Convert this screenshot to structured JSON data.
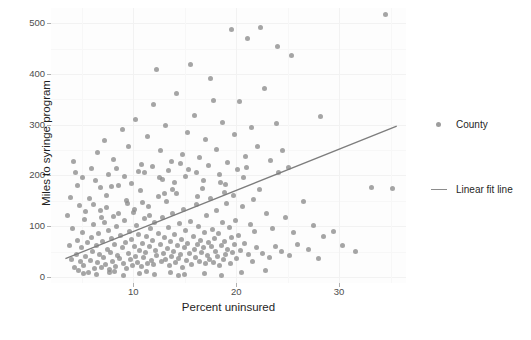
{
  "chart_data": {
    "type": "scatter",
    "title": "",
    "xlabel": "Percent uninsured",
    "ylabel": "Miles to syringe program",
    "xlim": [
      2.0,
      36.5
    ],
    "ylim": [
      -12,
      530
    ],
    "xticks": [
      10,
      20,
      30
    ],
    "xtick_labels": [
      "10",
      "20",
      "30"
    ],
    "yticks": [
      0,
      100,
      200,
      300,
      400,
      500
    ],
    "ytick_labels": [
      "0",
      "100",
      "200",
      "300",
      "400",
      "500"
    ],
    "grid": true,
    "legend_position": "right",
    "legend": [
      {
        "label": "County",
        "marker": "circle",
        "color": "#8c8c8c"
      },
      {
        "label": "Linear fit line",
        "marker": "line",
        "color": "#8c8c8c"
      }
    ],
    "series": [
      {
        "name": "County",
        "type": "scatter",
        "color": "#8c8c8c",
        "marker_size": 5,
        "opacity": 0.78,
        "points": [
          [
            3.6,
            122
          ],
          [
            3.8,
            61
          ],
          [
            4.0,
            35
          ],
          [
            4.1,
            96
          ],
          [
            4.3,
            18
          ],
          [
            4.4,
            205
          ],
          [
            4.5,
            44
          ],
          [
            4.6,
            72
          ],
          [
            4.7,
            12
          ],
          [
            4.8,
            140
          ],
          [
            4.9,
            30
          ],
          [
            5.0,
            58
          ],
          [
            5.1,
            88
          ],
          [
            5.2,
            22
          ],
          [
            5.3,
            113
          ],
          [
            5.4,
            41
          ],
          [
            5.5,
            67
          ],
          [
            5.6,
            9
          ],
          [
            5.7,
            155
          ],
          [
            5.8,
            33
          ],
          [
            5.9,
            78
          ],
          [
            6.0,
            51
          ],
          [
            6.1,
            104
          ],
          [
            6.2,
            16
          ],
          [
            6.3,
            190
          ],
          [
            6.4,
            62
          ],
          [
            6.5,
            28
          ],
          [
            6.6,
            86
          ],
          [
            6.7,
            45
          ],
          [
            6.8,
            130
          ],
          [
            6.9,
            19
          ],
          [
            7.0,
            70
          ],
          [
            7.1,
            39
          ],
          [
            7.2,
            108
          ],
          [
            7.3,
            25
          ],
          [
            7.4,
            160
          ],
          [
            7.5,
            55
          ],
          [
            7.6,
            92
          ],
          [
            7.7,
            14
          ],
          [
            7.8,
            48
          ],
          [
            7.9,
            75
          ],
          [
            8.0,
            31
          ],
          [
            8.1,
            120
          ],
          [
            8.2,
            64
          ],
          [
            8.3,
            21
          ],
          [
            8.4,
            99
          ],
          [
            8.5,
            43
          ],
          [
            8.6,
            180
          ],
          [
            8.7,
            36
          ],
          [
            8.8,
            82
          ],
          [
            8.9,
            57
          ],
          [
            9.0,
            26
          ],
          [
            9.1,
            111
          ],
          [
            9.2,
            68
          ],
          [
            9.3,
            17
          ],
          [
            9.4,
            145
          ],
          [
            9.5,
            47
          ],
          [
            9.6,
            90
          ],
          [
            9.7,
            34
          ],
          [
            9.8,
            73
          ],
          [
            9.9,
            23
          ],
          [
            10.0,
            127
          ],
          [
            10.1,
            59
          ],
          [
            10.2,
            40
          ],
          [
            10.3,
            101
          ],
          [
            10.4,
            29
          ],
          [
            10.5,
            84
          ],
          [
            10.6,
            52
          ],
          [
            10.7,
            170
          ],
          [
            10.8,
            20
          ],
          [
            10.9,
            66
          ],
          [
            11.0,
            38
          ],
          [
            11.1,
            115
          ],
          [
            11.2,
            49
          ],
          [
            11.3,
            79
          ],
          [
            11.4,
            27
          ],
          [
            11.5,
            138
          ],
          [
            11.6,
            60
          ],
          [
            11.7,
            95
          ],
          [
            11.8,
            32
          ],
          [
            11.9,
            71
          ],
          [
            12.0,
            24
          ],
          [
            12.1,
            107
          ],
          [
            12.2,
            53
          ],
          [
            12.3,
            42
          ],
          [
            12.4,
            86
          ],
          [
            12.5,
            196
          ],
          [
            12.6,
            63
          ],
          [
            12.7,
            30
          ],
          [
            12.8,
            118
          ],
          [
            12.9,
            46
          ],
          [
            13.0,
            77
          ],
          [
            13.1,
            35
          ],
          [
            13.2,
            148
          ],
          [
            13.3,
            56
          ],
          [
            13.4,
            98
          ],
          [
            13.5,
            22
          ],
          [
            13.6,
            69
          ],
          [
            13.7,
            41
          ],
          [
            13.8,
            125
          ],
          [
            13.9,
            50
          ],
          [
            14.0,
            83
          ],
          [
            14.1,
            28
          ],
          [
            14.2,
            165
          ],
          [
            14.3,
            61
          ],
          [
            14.4,
            37
          ],
          [
            14.5,
            105
          ],
          [
            14.6,
            44
          ],
          [
            14.7,
            74
          ],
          [
            14.8,
            19
          ],
          [
            14.9,
            133
          ],
          [
            15.0,
            58
          ],
          [
            15.1,
            91
          ],
          [
            15.2,
            33
          ],
          [
            15.3,
            66
          ],
          [
            15.4,
            212
          ],
          [
            15.5,
            47
          ],
          [
            15.6,
            110
          ],
          [
            15.7,
            25
          ],
          [
            15.8,
            80
          ],
          [
            15.9,
            54
          ],
          [
            16.0,
            39
          ],
          [
            16.1,
            142
          ],
          [
            16.2,
            64
          ],
          [
            16.3,
            100
          ],
          [
            16.4,
            31
          ],
          [
            16.5,
            72
          ],
          [
            16.6,
            48
          ],
          [
            16.7,
            175
          ],
          [
            16.8,
            57
          ],
          [
            16.9,
            88
          ],
          [
            17.0,
            26
          ],
          [
            17.1,
            121
          ],
          [
            17.2,
            43
          ],
          [
            17.3,
            67
          ],
          [
            17.4,
            35
          ],
          [
            17.5,
            155
          ],
          [
            17.6,
            59
          ],
          [
            17.7,
            94
          ],
          [
            17.8,
            29
          ],
          [
            17.9,
            76
          ],
          [
            18.0,
            51
          ],
          [
            18.1,
            130
          ],
          [
            18.2,
            40
          ],
          [
            18.3,
            85
          ],
          [
            18.4,
            23
          ],
          [
            18.5,
            186
          ],
          [
            18.6,
            62
          ],
          [
            18.7,
            108
          ],
          [
            18.8,
            34
          ],
          [
            18.9,
            70
          ],
          [
            19.0,
            45
          ],
          [
            19.1,
            145
          ],
          [
            19.2,
            55
          ],
          [
            19.3,
            97
          ],
          [
            19.4,
            27
          ],
          [
            19.5,
            78
          ],
          [
            19.6,
            49
          ],
          [
            19.7,
            160
          ],
          [
            19.8,
            63
          ],
          [
            19.9,
            112
          ],
          [
            20.0,
            36
          ],
          [
            20.2,
            82
          ],
          [
            20.4,
            52
          ],
          [
            20.6,
            138
          ],
          [
            20.8,
            66
          ],
          [
            21.0,
            215
          ],
          [
            21.2,
            44
          ],
          [
            21.4,
            103
          ],
          [
            21.6,
            30
          ],
          [
            21.8,
            90
          ],
          [
            22.0,
            57
          ],
          [
            22.3,
            172
          ],
          [
            22.6,
            47
          ],
          [
            22.9,
            125
          ],
          [
            23.2,
            38
          ],
          [
            23.5,
            96
          ],
          [
            23.8,
            60
          ],
          [
            24.1,
            205
          ],
          [
            24.4,
            50
          ],
          [
            24.8,
            117
          ],
          [
            25.2,
            42
          ],
          [
            25.6,
            88
          ],
          [
            26.0,
            64
          ],
          [
            26.5,
            148
          ],
          [
            27.0,
            55
          ],
          [
            27.5,
            102
          ],
          [
            28.0,
            36
          ],
          [
            28.5,
            80
          ],
          [
            6.5,
            245
          ],
          [
            7.2,
            268
          ],
          [
            8.1,
            232
          ],
          [
            8.9,
            290
          ],
          [
            9.5,
            258
          ],
          [
            10.2,
            310
          ],
          [
            10.8,
            222
          ],
          [
            11.4,
            276
          ],
          [
            12.0,
            340
          ],
          [
            12.6,
            250
          ],
          [
            13.1,
            299
          ],
          [
            13.7,
            228
          ],
          [
            14.2,
            362
          ],
          [
            14.8,
            241
          ],
          [
            15.3,
            285
          ],
          [
            15.9,
            318
          ],
          [
            16.4,
            235
          ],
          [
            17.0,
            271
          ],
          [
            17.5,
            392
          ],
          [
            18.1,
            252
          ],
          [
            18.7,
            305
          ],
          [
            19.2,
            226
          ],
          [
            19.8,
            281
          ],
          [
            20.3,
            345
          ],
          [
            20.9,
            238
          ],
          [
            21.5,
            294
          ],
          [
            22.1,
            258
          ],
          [
            22.7,
            372
          ],
          [
            23.3,
            229
          ],
          [
            23.9,
            302
          ],
          [
            24.5,
            250
          ],
          [
            25.1,
            216
          ],
          [
            12.3,
            408
          ],
          [
            15.6,
            418
          ],
          [
            17.8,
            347
          ],
          [
            19.5,
            488
          ],
          [
            21.1,
            470
          ],
          [
            22.4,
            491
          ],
          [
            24.0,
            455
          ],
          [
            25.4,
            437
          ],
          [
            28.2,
            316
          ],
          [
            29.5,
            90
          ],
          [
            30.3,
            62
          ],
          [
            31.6,
            50
          ],
          [
            33.1,
            176
          ],
          [
            34.5,
            518
          ],
          [
            35.2,
            175
          ],
          [
            4.2,
            228
          ],
          [
            5.1,
            196
          ],
          [
            5.9,
            213
          ],
          [
            6.8,
            176
          ],
          [
            7.6,
            202
          ],
          [
            3.9,
            156
          ],
          [
            4.6,
            181
          ],
          [
            11.1,
            205
          ],
          [
            11.9,
            218
          ],
          [
            12.8,
            192
          ],
          [
            13.4,
            210
          ],
          [
            14.0,
            186
          ],
          [
            14.6,
            224
          ],
          [
            15.1,
            198
          ],
          [
            16.1,
            206
          ],
          [
            16.8,
            190
          ],
          [
            17.3,
            219
          ],
          [
            18.4,
            201
          ],
          [
            19.0,
            183
          ],
          [
            20.1,
            212
          ],
          [
            20.7,
            195
          ],
          [
            9.1,
            197
          ],
          [
            9.8,
            184
          ],
          [
            10.5,
            208
          ],
          [
            8.4,
            213
          ],
          [
            7.9,
            178
          ],
          [
            13.0,
            165
          ],
          [
            13.8,
            172
          ],
          [
            16.2,
            158
          ],
          [
            18.9,
            167
          ],
          [
            21.7,
            152
          ],
          [
            5.4,
            129
          ],
          [
            6.1,
            143
          ],
          [
            6.9,
            118
          ],
          [
            7.4,
            136
          ],
          [
            8.6,
            124
          ],
          [
            9.3,
            151
          ],
          [
            10.1,
            132
          ],
          [
            10.9,
            147
          ],
          [
            11.6,
            121
          ],
          [
            12.4,
            159
          ],
          [
            5.2,
            6
          ],
          [
            6.4,
            4
          ],
          [
            7.7,
            8
          ],
          [
            9.0,
            3
          ],
          [
            10.6,
            7
          ],
          [
            12.1,
            5
          ],
          [
            13.6,
            9
          ],
          [
            15.0,
            4
          ],
          [
            16.9,
            6
          ],
          [
            18.6,
            3
          ],
          [
            20.5,
            8
          ],
          [
            22.8,
            12
          ],
          [
            14.4,
            2
          ],
          [
            11.3,
            11
          ],
          [
            8.2,
            10
          ]
        ]
      },
      {
        "name": "Linear fit line",
        "type": "line",
        "color": "#7d7d7d",
        "x_start": 3.4,
        "y_start": 36,
        "x_end": 35.6,
        "y_end": 297
      }
    ]
  }
}
